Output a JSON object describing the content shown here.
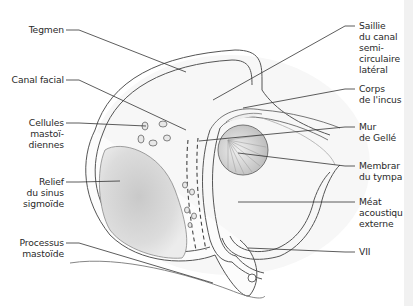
{
  "figure": {
    "type": "anatomical illustration",
    "colors": {
      "outline": "#4a4a4a",
      "leader": "#333333",
      "shading": "#d8d8d8",
      "edge_strip": "#f1f1f1"
    }
  },
  "labels_left": [
    {
      "id": "tegmen",
      "lines": [
        "Tegmen"
      ]
    },
    {
      "id": "canal-facial",
      "lines": [
        "Canal facial"
      ]
    },
    {
      "id": "cellules-mastoidiennes",
      "lines": [
        "Cellules",
        "mastoï-",
        "diennes"
      ]
    },
    {
      "id": "relief-sinus-sigmoide",
      "lines": [
        "Relief",
        "du sinus",
        "sigmoïde"
      ]
    },
    {
      "id": "processus-mastoide",
      "lines": [
        "Processus",
        "mastoïde"
      ]
    }
  ],
  "labels_right": [
    {
      "id": "saillie-canal-semicirculaire",
      "lines": [
        "Saillie",
        "du canal",
        "semi-",
        "circulaire",
        "latéral"
      ]
    },
    {
      "id": "corps-incus",
      "lines": [
        "Corps",
        "de l'incus"
      ]
    },
    {
      "id": "mur-gelle",
      "lines": [
        "Mur",
        "de Gellé"
      ]
    },
    {
      "id": "membrane-tympan",
      "lines": [
        "Membrar",
        "du tympa"
      ]
    },
    {
      "id": "meat-acoustique",
      "lines": [
        "Méat",
        "acoustiqu",
        "externe"
      ]
    },
    {
      "id": "nerf-vii",
      "lines": [
        "VII"
      ]
    }
  ]
}
